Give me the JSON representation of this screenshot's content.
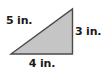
{
  "figure": {
    "type": "right-triangle-diagram",
    "background_color": "#ffffff",
    "shape": {
      "name": "right triangle",
      "fill_color": "#c5c5c5",
      "stroke_color": "#4a4a4a",
      "stroke_width": 1.4,
      "vertices": [
        {
          "name": "bottom-left",
          "x": 11,
          "y": 54
        },
        {
          "name": "bottom-right",
          "x": 72.5,
          "y": 54
        },
        {
          "name": "top-right",
          "x": 72.5,
          "y": 9
        }
      ]
    },
    "labels": {
      "hypotenuse": "5 in.",
      "vertical_leg": "3 in.",
      "base_leg": "4 in."
    },
    "text_color": "#1a1a1a"
  },
  "chart_data": {
    "type": "table",
    "categories": [
      "Hypotenuse",
      "Vertical leg",
      "Base leg"
    ],
    "values": [
      5,
      3,
      4
    ],
    "unit": "in.",
    "labels": [
      "5 in.",
      "3 in.",
      "4 in."
    ]
  }
}
